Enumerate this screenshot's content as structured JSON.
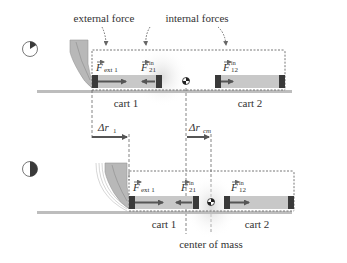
{
  "annotations": {
    "external_force": "external force",
    "internal_forces": "internal forces",
    "center_of_mass": "center of mass"
  },
  "panels": [
    {
      "id": "before",
      "clock_fraction": 0.15,
      "carts": [
        {
          "label": "cart 1"
        },
        {
          "label": "cart 2"
        }
      ],
      "forces": {
        "ext": {
          "sym": "F",
          "sub": "ext 1"
        },
        "f21": {
          "sym": "F",
          "sup": "in",
          "sub": "21"
        },
        "f12": {
          "sym": "F",
          "sup": "in",
          "sub": "12"
        }
      }
    },
    {
      "id": "after",
      "clock_fraction": 0.5,
      "carts": [
        {
          "label": "cart 1"
        },
        {
          "label": "cart 2"
        }
      ],
      "forces": {
        "ext": {
          "sym": "F",
          "sub": "ext 1"
        },
        "f21": {
          "sym": "F",
          "sup": "in",
          "sub": "21"
        },
        "f12": {
          "sym": "F",
          "sup": "in",
          "sub": "12"
        }
      }
    }
  ],
  "displacements": {
    "dr1": {
      "sym": "Δr",
      "sub": "1"
    },
    "drcm": {
      "sym": "Δr",
      "sub": "cm"
    }
  },
  "colors": {
    "cart_body": "#c8c8c8",
    "cart_end": "#3a3a3a",
    "arrow": "#555555",
    "track": "#bdbdbd",
    "hand": "#b5b5b5",
    "dotted": "#777777",
    "glow": "#e6e6e6"
  }
}
